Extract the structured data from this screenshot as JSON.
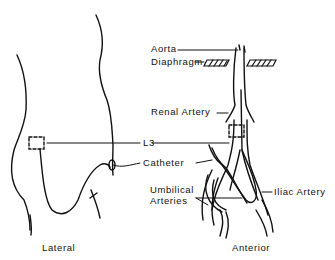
{
  "labels": {
    "aorta": "Aorta",
    "diaphragm": "Diaphragm",
    "renal_artery": "Renal Artery",
    "l3": "L3",
    "catheter": "Catheter",
    "umbilical_arteries_line1": "Umbilical",
    "umbilical_arteries_line2": "Arteries",
    "iliac_artery": "Iliac Artery"
  },
  "captions": {
    "lateral": "Lateral",
    "anterior": "Anterior"
  }
}
